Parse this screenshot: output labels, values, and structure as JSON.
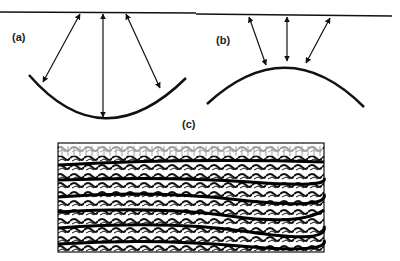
{
  "figure": {
    "panels": [
      {
        "id": "a",
        "label": "(a)",
        "description": "Syncline reflector: downward-curving bowl beneath surface line with three two-way ray arrows"
      },
      {
        "id": "b",
        "label": "(b)",
        "description": "Anticline reflector: upward dome beneath surface line with three two-way ray arrows"
      },
      {
        "id": "c",
        "label": "(c)",
        "description": "Seismic section (wiggle-trace) showing layered reflections"
      }
    ]
  },
  "colors": {
    "ink": "#111111",
    "background": "#ffffff"
  }
}
